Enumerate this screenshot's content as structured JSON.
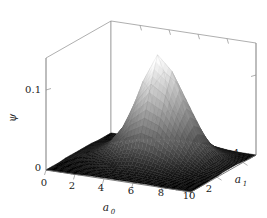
{
  "figure": {
    "kind": "surface-plot-3d",
    "background": "#ffffff",
    "width": 267,
    "height": 218
  },
  "axes": {
    "x": {
      "label": "a",
      "subscript": "0",
      "ticks": [
        "0",
        "2",
        "4",
        "6",
        "8",
        "10"
      ],
      "range": [
        0,
        10
      ]
    },
    "y": {
      "label": "a",
      "subscript": "1",
      "ticks": [
        "2",
        "4"
      ],
      "range": [
        0,
        5
      ]
    },
    "z": {
      "label": "ψ",
      "ticks": [
        "0",
        "0.1"
      ],
      "range": [
        0,
        0.14
      ]
    }
  },
  "colors": {
    "spine": "#8c8c8c",
    "tick_text": "#1a1a1a",
    "surface_low": "#000000",
    "surface_high": "#ffffff",
    "mesh_line": "#5a5a5a"
  },
  "chart_data": {
    "type": "surface",
    "title": "",
    "xlabel": "a_0",
    "ylabel": "a_1",
    "zlabel": "psi",
    "xlim": [
      0,
      10
    ],
    "ylim": [
      0,
      5
    ],
    "zlim": [
      0,
      0.14
    ],
    "grid": false,
    "legend": false,
    "colormap": "gray",
    "peak": {
      "x": 5.5,
      "y": 3.0,
      "z": 0.13
    },
    "x": [
      0,
      1,
      2,
      3,
      4,
      5,
      6,
      7,
      8,
      9,
      10
    ],
    "y": [
      0,
      0.5,
      1.0,
      1.5,
      2.0,
      2.5,
      3.0,
      3.5,
      4.0,
      4.5,
      5.0
    ],
    "z_matrix": [
      [
        0.0,
        0.0,
        0.0,
        0.001,
        0.001,
        0.001,
        0.001,
        0.001,
        0.0,
        0.0,
        0.0
      ],
      [
        0.0,
        0.0,
        0.001,
        0.002,
        0.003,
        0.003,
        0.003,
        0.002,
        0.001,
        0.0,
        0.0
      ],
      [
        0.0,
        0.001,
        0.002,
        0.005,
        0.008,
        0.01,
        0.009,
        0.006,
        0.003,
        0.001,
        0.0
      ],
      [
        0.001,
        0.002,
        0.005,
        0.012,
        0.022,
        0.027,
        0.024,
        0.016,
        0.007,
        0.002,
        0.001
      ],
      [
        0.001,
        0.004,
        0.01,
        0.025,
        0.048,
        0.06,
        0.053,
        0.034,
        0.015,
        0.005,
        0.001
      ],
      [
        0.001,
        0.005,
        0.014,
        0.037,
        0.074,
        0.098,
        0.086,
        0.054,
        0.023,
        0.007,
        0.002
      ],
      [
        0.001,
        0.005,
        0.016,
        0.043,
        0.094,
        0.13,
        0.112,
        0.068,
        0.028,
        0.008,
        0.002
      ],
      [
        0.001,
        0.004,
        0.013,
        0.036,
        0.078,
        0.104,
        0.091,
        0.057,
        0.024,
        0.007,
        0.002
      ],
      [
        0.0,
        0.002,
        0.007,
        0.019,
        0.039,
        0.052,
        0.046,
        0.03,
        0.013,
        0.004,
        0.001
      ],
      [
        0.0,
        0.001,
        0.003,
        0.007,
        0.014,
        0.019,
        0.017,
        0.011,
        0.005,
        0.002,
        0.0
      ],
      [
        0.0,
        0.0,
        0.001,
        0.002,
        0.004,
        0.005,
        0.005,
        0.003,
        0.001,
        0.0,
        0.0
      ]
    ]
  }
}
